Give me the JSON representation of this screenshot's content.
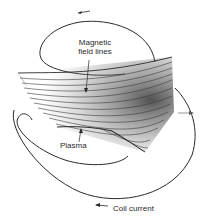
{
  "figure": {
    "labels": {
      "field_line_1": "Magnetic",
      "field_line_2": "field lines",
      "plasma": "Plasma",
      "coil_current": "Coil current"
    },
    "arrows": {
      "top": "←",
      "right": "→",
      "bottom": "←"
    },
    "colors": {
      "ink": "#2a2a2a",
      "shade": "#555555",
      "background": "#ffffff"
    }
  }
}
